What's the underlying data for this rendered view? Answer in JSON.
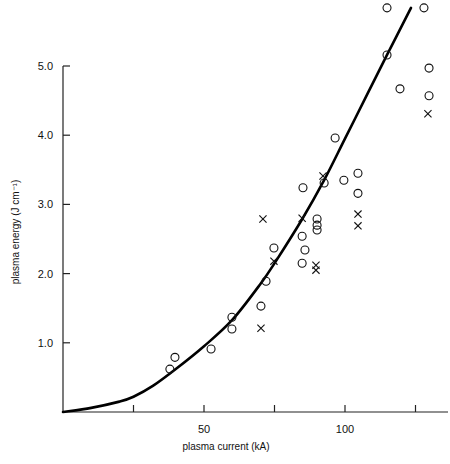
{
  "chart_data": {
    "type": "scatter",
    "title": "",
    "xlabel": "plasma current (kA)",
    "ylabel": "plasma energy (J cm⁻¹)",
    "xlim": [
      0,
      135
    ],
    "ylim": [
      0,
      5.9
    ],
    "grid": false,
    "x_ticks": [
      25,
      50,
      75,
      100,
      125
    ],
    "x_tick_labels": [
      "",
      "50",
      "",
      "100",
      ""
    ],
    "y_ticks": [
      1.0,
      2.0,
      3.0,
      4.0,
      5.0
    ],
    "y_tick_labels": [
      "1.0",
      "2.0",
      "3.0",
      "4.0",
      "5.0"
    ],
    "series": [
      {
        "name": "circles",
        "marker": "circle",
        "points": [
          [
            37.9,
            0.62
          ],
          [
            39.7,
            0.79
          ],
          [
            52.5,
            0.91
          ],
          [
            59.9,
            1.37
          ],
          [
            59.9,
            1.2
          ],
          [
            70.2,
            1.53
          ],
          [
            72.0,
            1.89
          ],
          [
            74.8,
            2.37
          ],
          [
            84.8,
            2.54
          ],
          [
            85.8,
            2.34
          ],
          [
            84.8,
            2.15
          ],
          [
            85.1,
            3.24
          ],
          [
            90.1,
            2.79
          ],
          [
            90.1,
            2.7
          ],
          [
            90.1,
            2.63
          ],
          [
            92.6,
            3.31
          ],
          [
            96.5,
            3.96
          ],
          [
            99.6,
            3.35
          ],
          [
            104.6,
            3.45
          ],
          [
            104.6,
            3.16
          ],
          [
            114.9,
            5.84
          ],
          [
            114.9,
            5.16
          ],
          [
            119.5,
            4.67
          ],
          [
            128.0,
            5.84
          ],
          [
            129.8,
            4.97
          ],
          [
            129.8,
            4.57
          ]
        ]
      },
      {
        "name": "crosses",
        "marker": "cross",
        "points": [
          [
            70.2,
            1.21
          ],
          [
            70.9,
            2.79
          ],
          [
            74.8,
            2.18
          ],
          [
            84.8,
            2.8
          ],
          [
            89.7,
            2.12
          ],
          [
            89.7,
            2.05
          ],
          [
            92.2,
            3.41
          ],
          [
            104.6,
            2.86
          ],
          [
            104.6,
            2.69
          ],
          [
            129.4,
            4.31
          ]
        ]
      },
      {
        "name": "fit curve",
        "marker": "line",
        "points": [
          [
            0,
            0
          ],
          [
            10,
            0.06
          ],
          [
            20,
            0.15
          ],
          [
            25,
            0.22
          ],
          [
            32,
            0.38
          ],
          [
            40,
            0.62
          ],
          [
            50,
            0.95
          ],
          [
            60,
            1.33
          ],
          [
            70,
            1.85
          ],
          [
            75.5,
            2.18
          ],
          [
            85,
            2.8
          ],
          [
            92.6,
            3.35
          ],
          [
            100,
            3.95
          ],
          [
            108,
            4.6
          ],
          [
            114.9,
            5.16
          ],
          [
            123.4,
            5.84
          ]
        ]
      }
    ]
  }
}
